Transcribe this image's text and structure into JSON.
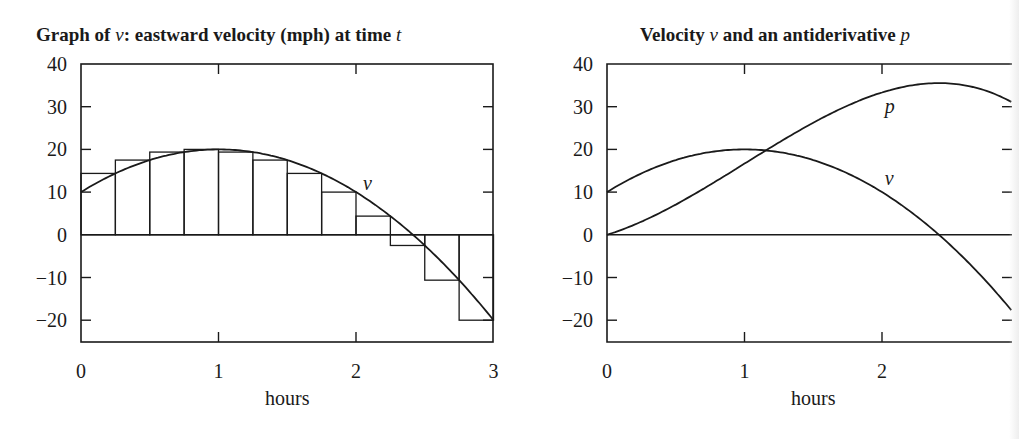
{
  "chart_data": [
    {
      "type": "line",
      "title": "Graph of v: eastward velocity (mph) at time t",
      "title_parts": {
        "pre": "Graph of ",
        "var1": "v",
        "mid": ": eastward velocity (mph) at time ",
        "var2": "t"
      },
      "xlabel": "hours",
      "ylabel": "",
      "xlim": [
        0,
        3
      ],
      "ylim": [
        -25,
        40
      ],
      "xticks": [
        "0",
        "1",
        "2",
        "3"
      ],
      "yticks": [
        "40",
        "30",
        "20",
        "10",
        "0",
        "−10",
        "−20"
      ],
      "grid": false,
      "series": [
        {
          "name": "v",
          "formula": "v(t) = 10 + 20t - 10t^2",
          "x": [
            0,
            0.25,
            0.5,
            0.75,
            1.0,
            1.25,
            1.5,
            1.75,
            2.0,
            2.25,
            2.5,
            2.75,
            3.0
          ],
          "values": [
            10,
            14.375,
            17.5,
            19.375,
            20,
            19.375,
            17.5,
            14.375,
            10,
            4.375,
            -2.5,
            -10.625,
            -20
          ]
        }
      ],
      "riemann_rectangles": {
        "width": 0.25,
        "rule": "right endpoint",
        "x_left": [
          0,
          0.25,
          0.5,
          0.75,
          1.0,
          1.25,
          1.5,
          1.75,
          2.0,
          2.25,
          2.5,
          2.75
        ],
        "heights": [
          14.375,
          17.5,
          19.375,
          20,
          19.375,
          17.5,
          14.375,
          10,
          4.375,
          -2.5,
          -10.625,
          -20
        ]
      },
      "annotations": [
        {
          "text": "v",
          "x": 2.05,
          "y": 12
        }
      ]
    },
    {
      "type": "line",
      "title": "Velocity v and an antiderivative p",
      "title_parts": {
        "pre": "Velocity ",
        "var1": "v",
        "mid": " and an antiderivative ",
        "var2": "p"
      },
      "xlabel": "hours",
      "ylabel": "",
      "xlim": [
        0,
        2.95
      ],
      "ylim": [
        -25,
        40
      ],
      "xticks": [
        "0",
        "1",
        "2"
      ],
      "yticks": [
        "40",
        "30",
        "20",
        "10",
        "0",
        "−10",
        "−20"
      ],
      "grid": false,
      "series": [
        {
          "name": "v",
          "formula": "v(t) = 10 + 20t - 10t^2",
          "x": [
            0,
            0.5,
            1.0,
            1.5,
            2.0,
            2.5,
            2.95
          ],
          "values": [
            10,
            17.5,
            20,
            17.5,
            10,
            -2.5,
            -18
          ]
        },
        {
          "name": "p",
          "formula": "p(t) = 10t + 10t^2 - (10/3)t^3",
          "x": [
            0,
            0.5,
            1.0,
            1.5,
            2.0,
            2.42,
            2.95
          ],
          "values": [
            0,
            7.1,
            16.7,
            26.3,
            33.3,
            35.3,
            31.6
          ]
        }
      ],
      "annotations": [
        {
          "text": "p",
          "x": 2.02,
          "y": 30
        },
        {
          "text": "v",
          "x": 2.02,
          "y": 13
        }
      ]
    }
  ]
}
